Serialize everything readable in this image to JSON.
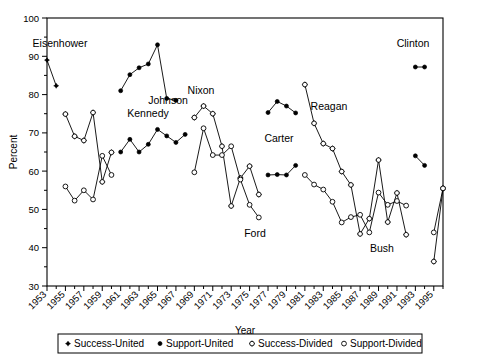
{
  "figure": {
    "title": "",
    "y_axis_label": "Percent",
    "x_axis_label": "Year"
  },
  "annotations": [
    {
      "name": "eisenhower",
      "label": "Eisenhower",
      "x": 60,
      "y": 47
    },
    {
      "name": "kennedy",
      "label": "Kennedy",
      "x": 148,
      "y": 117
    },
    {
      "name": "johnson",
      "label": "Johnson",
      "x": 168,
      "y": 104
    },
    {
      "name": "nixon",
      "label": "Nixon",
      "x": 201,
      "y": 94
    },
    {
      "name": "ford",
      "label": "Ford",
      "x": 255,
      "y": 237
    },
    {
      "name": "carter",
      "label": "Carter",
      "x": 279,
      "y": 142
    },
    {
      "name": "reagan",
      "label": "Reagan",
      "x": 329,
      "y": 110
    },
    {
      "name": "bush",
      "label": "Bush",
      "x": 382,
      "y": 252
    },
    {
      "name": "clinton",
      "label": "Clinton",
      "x": 413,
      "y": 47
    }
  ],
  "legend": {
    "items": [
      {
        "name": "legend-success-united",
        "label": "Success-United",
        "marker": "filled-plus"
      },
      {
        "name": "legend-support-united",
        "label": "Support-United",
        "marker": "filled-circle"
      },
      {
        "name": "legend-success-divided",
        "label": "Success-Divided",
        "marker": "open-plus"
      },
      {
        "name": "legend-support-divided",
        "label": "Support-Divided",
        "marker": "open-circle"
      }
    ]
  },
  "chart_data": {
    "type": "line",
    "title": "",
    "xlabel": "Year",
    "ylabel": "Percent",
    "xlim": [
      1953,
      1996
    ],
    "ylim": [
      30,
      100
    ],
    "ytick_values": [
      30,
      40,
      50,
      60,
      70,
      80,
      90,
      100
    ],
    "xtick_labels": [
      "1953",
      "1955",
      "1957",
      "1959",
      "1961",
      "1963",
      "1965",
      "1967",
      "1969",
      "1971",
      "1973",
      "1975",
      "1977",
      "1979",
      "1981",
      "1983",
      "1985",
      "1987",
      "1989",
      "1991",
      "1993",
      "1995"
    ],
    "xtick_values": [
      1953,
      1955,
      1957,
      1959,
      1961,
      1963,
      1965,
      1967,
      1969,
      1971,
      1973,
      1975,
      1977,
      1979,
      1981,
      1983,
      1985,
      1987,
      1989,
      1991,
      1993,
      1995
    ],
    "grid": false,
    "legend_position": "below",
    "series": [
      {
        "name": "Success-United",
        "marker": "filled-plus",
        "points": [
          [
            1953,
            89.0
          ],
          [
            1954,
            82.3
          ]
        ]
      },
      {
        "name": "Support-United",
        "marker": "filled-circle",
        "points": [
          [
            1961,
            81.0
          ],
          [
            1962,
            85.2
          ],
          [
            1963,
            87.0
          ],
          [
            1964,
            88.0
          ],
          [
            1965,
            93.0
          ],
          [
            1966,
            79.0
          ],
          [
            1967,
            78.5
          ],
          [
            1977,
            75.3
          ],
          [
            1978,
            78.2
          ],
          [
            1979,
            77.0
          ],
          [
            1980,
            75.2
          ],
          [
            1993,
            87.2
          ],
          [
            1994,
            87.2
          ],
          [
            1961,
            65.0
          ],
          [
            1962,
            68.3
          ],
          [
            1963,
            65.0
          ],
          [
            1964,
            67.0
          ],
          [
            1965,
            70.9
          ],
          [
            1966,
            69.2
          ],
          [
            1967,
            67.5
          ],
          [
            1968,
            69.6
          ],
          [
            1977,
            59.0
          ],
          [
            1978,
            59.1
          ],
          [
            1979,
            59.0
          ],
          [
            1980,
            61.5
          ],
          [
            1993,
            64.0
          ],
          [
            1994,
            61.5
          ]
        ]
      },
      {
        "name": "Success-Divided",
        "marker": "open-plus",
        "points": [
          [
            1955,
            74.9
          ],
          [
            1956,
            69.1
          ],
          [
            1957,
            68.0
          ],
          [
            1958,
            75.3
          ],
          [
            1959,
            57.2
          ],
          [
            1960,
            64.9
          ],
          [
            1969,
            74.0
          ],
          [
            1970,
            77.0
          ],
          [
            1971,
            75.0
          ],
          [
            1972,
            66.5
          ],
          [
            1973,
            50.9
          ],
          [
            1974,
            58.2
          ],
          [
            1975,
            61.3
          ],
          [
            1976,
            53.9
          ],
          [
            1981,
            82.6
          ],
          [
            1982,
            72.5
          ],
          [
            1983,
            67.2
          ],
          [
            1984,
            65.9
          ],
          [
            1985,
            59.9
          ],
          [
            1986,
            56.4
          ],
          [
            1987,
            43.6
          ],
          [
            1988,
            47.6
          ],
          [
            1989,
            62.9
          ],
          [
            1990,
            46.7
          ],
          [
            1991,
            54.3
          ],
          [
            1992,
            43.4
          ],
          [
            1995,
            36.4
          ],
          [
            1996,
            55.5
          ]
        ]
      },
      {
        "name": "Support-Divided",
        "marker": "open-circle",
        "points": [
          [
            1955,
            56.0
          ],
          [
            1956,
            52.3
          ],
          [
            1957,
            55.0
          ],
          [
            1958,
            52.6
          ],
          [
            1959,
            64.0
          ],
          [
            1960,
            59.0
          ],
          [
            1969,
            59.7
          ],
          [
            1970,
            71.2
          ],
          [
            1971,
            64.2
          ],
          [
            1972,
            64.2
          ],
          [
            1973,
            66.5
          ],
          [
            1974,
            57.8
          ],
          [
            1975,
            51.2
          ],
          [
            1976,
            47.9
          ],
          [
            1981,
            59.0
          ],
          [
            1982,
            56.5
          ],
          [
            1983,
            55.2
          ],
          [
            1984,
            52.0
          ],
          [
            1985,
            46.6
          ],
          [
            1986,
            48.0
          ],
          [
            1987,
            48.6
          ],
          [
            1988,
            44.0
          ],
          [
            1989,
            54.4
          ],
          [
            1990,
            51.2
          ],
          [
            1991,
            52.2
          ],
          [
            1992,
            51.0
          ],
          [
            1995,
            44.0
          ],
          [
            1996,
            55.5
          ]
        ]
      }
    ]
  },
  "geometry": {
    "plot_left": 47,
    "plot_right": 443,
    "plot_top": 18,
    "plot_bottom": 286,
    "x_year_min": 1953,
    "x_year_max": 1996,
    "y_min": 30,
    "y_max": 100
  },
  "paths": {
    "success_united": "47,18.8 56.2,44.4",
    "support_united_a": "129.8,90.8 139,74.7 148.2,67.8 157.4,64.0 166.6,45.0 175.8,98.5 185,100.4",
    "support_united_b": "277,100.0 286.2,89.0 295.4,93.5 304.6,100.4",
    "support_united_c": "415,86.4 424.2,86.4",
    "support_united_d": "129.8,152.0 139,139.3 148.2,152.0 157.4,144.3 166.6,129.3 175.8,135.8 185,142.3 194.2,134.3",
    "support_united_e": "277,175.0 286.2,174.6 295.4,175.0 304.6,165.4",
    "support_united_f": "415,156.0 424.2,165.6",
    "success_divided": "65.4,114.0 74.6,136.2 83.8,140.4 93,112.4 102.2,181.6 111.4,152.1 203.4,117.6 212.6,106.1 221.8,113.7 231,146.3 240.2,206.0 249.4,178.0 258.6,166.8 267.8,195.1 295.4,100.0 304.6,138.7 313.8,158.9 323,163.9 332.2,186.9 341.4,200.3 350.6,249.3 359.8,234.0 369,175.1 378.2,237.1 387.4,208.0 396.6,241.5 424.2,264.3 433.4,191.2",
    "support_divided": "65.4,183.5 74.6,197.7 83.8,187.4 93,196.5 102.2,152.9 111.4,172.0 203.4,172.1 212.6,128.0 221.8,154.8 231,154.8 240.2,146.1 249.4,179.4 258.6,204.7 267.8,217.3 295.4,172.0 304.6,181.6 313.8,186.6 323,198.8 343,219.4 341.4,214.0 350.6,211.7 367,228.3 369,193.8 378.2,206.0 387.4,202.2 396.6,206.8 424.2,233.7 433.4,191.2"
  }
}
